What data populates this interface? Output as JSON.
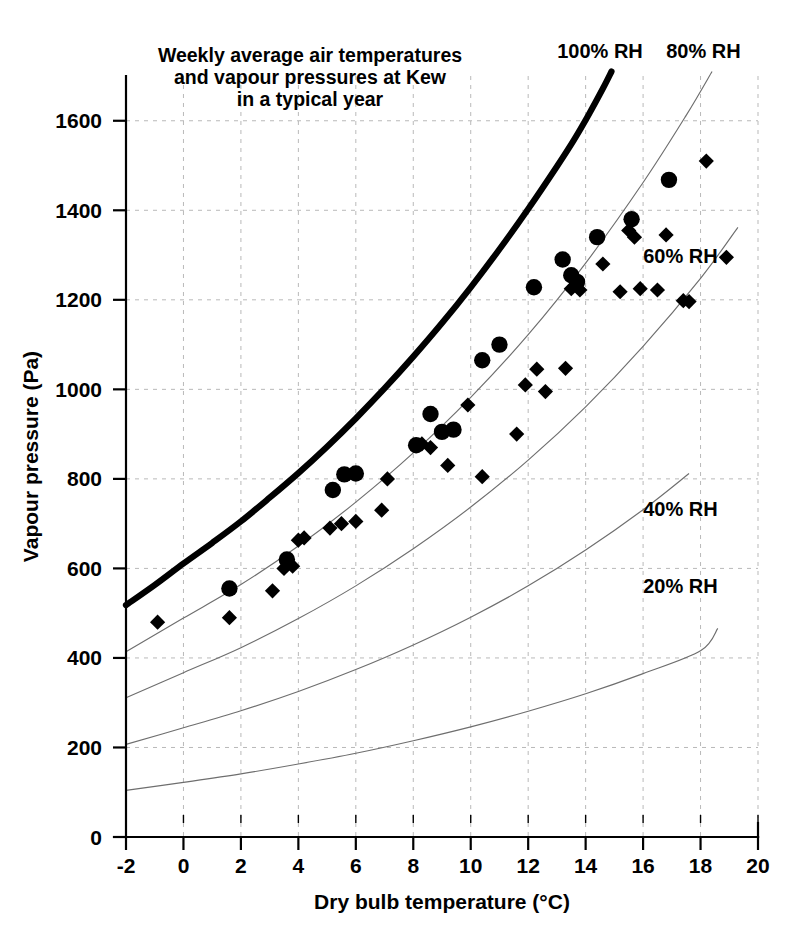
{
  "chart_data": {
    "type": "scatter",
    "title_lines": [
      "Weekly average air temperatures",
      "and vapour pressures at Kew",
      "in a typical year"
    ],
    "xlabel": "Dry bulb temperature (°C)",
    "ylabel": "Vapour pressure (Pa)",
    "xlim": [
      -2,
      20
    ],
    "ylim": [
      0,
      1700
    ],
    "xticks": [
      -2,
      0,
      2,
      4,
      6,
      8,
      10,
      12,
      14,
      16,
      18,
      20
    ],
    "xtick_labels": [
      "-2",
      "0",
      "2",
      "4",
      "6",
      "8",
      "10",
      "12",
      "14",
      "16",
      "18",
      "20"
    ],
    "yticks": [
      0,
      200,
      400,
      600,
      800,
      1000,
      1200,
      1400,
      1600
    ],
    "ytick_labels": [
      "0",
      "200",
      "400",
      "600",
      "800",
      "1000",
      "1200",
      "1400",
      "1600"
    ],
    "grid": true,
    "grid_style": "dashed",
    "grid_color": "#b9b9b9",
    "legend": "none",
    "series": [
      {
        "name": "Weekly average (circle markers)",
        "marker": "circle",
        "color": "#000000",
        "points": [
          [
            1.6,
            555
          ],
          [
            3.6,
            620
          ],
          [
            5.2,
            775
          ],
          [
            5.6,
            810
          ],
          [
            6.0,
            812
          ],
          [
            8.1,
            875
          ],
          [
            8.6,
            945
          ],
          [
            9.0,
            905
          ],
          [
            9.4,
            910
          ],
          [
            10.4,
            1065
          ],
          [
            11.0,
            1100
          ],
          [
            12.2,
            1228
          ],
          [
            13.2,
            1290
          ],
          [
            13.5,
            1255
          ],
          [
            13.7,
            1240
          ],
          [
            14.4,
            1340
          ],
          [
            15.6,
            1380
          ],
          [
            16.9,
            1468
          ]
        ]
      },
      {
        "name": "Weekly average (diamond markers)",
        "marker": "diamond",
        "color": "#000000",
        "points": [
          [
            -0.9,
            480
          ],
          [
            1.6,
            490
          ],
          [
            3.1,
            550
          ],
          [
            3.5,
            600
          ],
          [
            3.8,
            605
          ],
          [
            4.0,
            663
          ],
          [
            4.2,
            668
          ],
          [
            5.1,
            690
          ],
          [
            5.5,
            700
          ],
          [
            6.0,
            705
          ],
          [
            6.9,
            730
          ],
          [
            7.1,
            800
          ],
          [
            8.3,
            878
          ],
          [
            8.6,
            870
          ],
          [
            9.2,
            830
          ],
          [
            9.9,
            965
          ],
          [
            10.4,
            805
          ],
          [
            11.6,
            900
          ],
          [
            11.9,
            1010
          ],
          [
            12.3,
            1045
          ],
          [
            12.6,
            995
          ],
          [
            13.3,
            1047
          ],
          [
            13.5,
            1225
          ],
          [
            13.8,
            1222
          ],
          [
            14.6,
            1280
          ],
          [
            15.2,
            1218
          ],
          [
            15.5,
            1355
          ],
          [
            15.7,
            1340
          ],
          [
            15.9,
            1225
          ],
          [
            16.5,
            1222
          ],
          [
            16.8,
            1345
          ],
          [
            17.4,
            1198
          ],
          [
            17.6,
            1196
          ],
          [
            18.2,
            1510
          ],
          [
            18.9,
            1295
          ]
        ]
      }
    ],
    "rh_curves": [
      {
        "label": "100% RH",
        "rh": 100,
        "emphasis": true,
        "label_x": 14.5,
        "label_y": 1740,
        "points": [
          [
            -2,
            518
          ],
          [
            -1,
            563
          ],
          [
            0,
            611
          ],
          [
            1,
            657
          ],
          [
            2,
            705
          ],
          [
            3,
            758
          ],
          [
            4,
            813
          ],
          [
            5,
            872
          ],
          [
            6,
            935
          ],
          [
            7,
            1002
          ],
          [
            8,
            1073
          ],
          [
            9,
            1148
          ],
          [
            10,
            1228
          ],
          [
            11,
            1313
          ],
          [
            12,
            1403
          ],
          [
            13,
            1498
          ],
          [
            13.6,
            1558
          ],
          [
            14.1,
            1613
          ],
          [
            14.6,
            1672
          ],
          [
            14.9,
            1710
          ]
        ]
      },
      {
        "label": "80% RH",
        "rh": 80,
        "emphasis": false,
        "label_x": 18.1,
        "label_y": 1740,
        "points": [
          [
            -2,
            414
          ],
          [
            0,
            489
          ],
          [
            2,
            564
          ],
          [
            4,
            650
          ],
          [
            6,
            748
          ],
          [
            8,
            858
          ],
          [
            10,
            982
          ],
          [
            12,
            1122
          ],
          [
            14,
            1282
          ],
          [
            16,
            1462
          ],
          [
            17.5,
            1612
          ],
          [
            18.4,
            1710
          ]
        ]
      },
      {
        "label": "60% RH",
        "rh": 60,
        "emphasis": false,
        "label_x": 17.3,
        "label_y": 1283,
        "points": [
          [
            -2,
            311
          ],
          [
            0,
            367
          ],
          [
            2,
            423
          ],
          [
            4,
            488
          ],
          [
            6,
            561
          ],
          [
            8,
            644
          ],
          [
            10,
            737
          ],
          [
            12,
            842
          ],
          [
            14,
            961
          ],
          [
            16,
            1096
          ],
          [
            18,
            1248
          ],
          [
            19.3,
            1362
          ]
        ]
      },
      {
        "label": "40% RH",
        "rh": 40,
        "emphasis": false,
        "label_x": 17.3,
        "label_y": 718,
        "points": [
          [
            -2,
            207
          ],
          [
            0,
            244
          ],
          [
            2,
            282
          ],
          [
            4,
            325
          ],
          [
            6,
            374
          ],
          [
            8,
            429
          ],
          [
            10,
            491
          ],
          [
            12,
            561
          ],
          [
            14,
            641
          ],
          [
            16,
            731
          ],
          [
            17.6,
            812
          ]
        ]
      },
      {
        "label": "20% RH",
        "rh": 20,
        "emphasis": false,
        "label_x": 17.3,
        "label_y": 545,
        "points": [
          [
            -2,
            104
          ],
          [
            0,
            122
          ],
          [
            2,
            141
          ],
          [
            4,
            163
          ],
          [
            6,
            187
          ],
          [
            8,
            215
          ],
          [
            10,
            246
          ],
          [
            12,
            281
          ],
          [
            14,
            320
          ],
          [
            16,
            365
          ],
          [
            18,
            416
          ],
          [
            18.6,
            466
          ]
        ]
      }
    ]
  }
}
